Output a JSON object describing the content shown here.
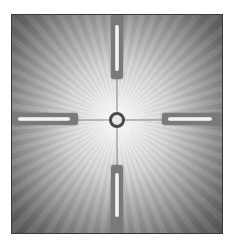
{
  "image": {
    "subject": "crosshair reticle",
    "description": "Grayscale view of a reticle with four thick posts, thin crosshair lines and a small center ring over a radial light gradient",
    "colors": {
      "center": "#ffffff",
      "edge": "#555555",
      "frame_border": "#3a3a3a",
      "posts": "#7a7a7a",
      "ring": "#4a4a4a"
    }
  }
}
